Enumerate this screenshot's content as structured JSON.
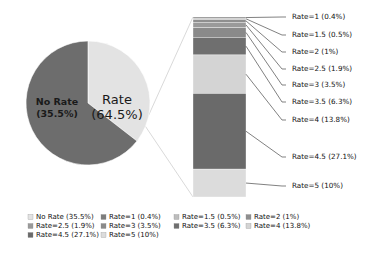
{
  "chart_data": {
    "type": "pie",
    "title": "",
    "subtitle": "",
    "xlabel": "",
    "ylabel": "",
    "legend_position": "bottom",
    "grid": false,
    "pie": {
      "categories": [
        "No Rate",
        "Rate"
      ],
      "values": [
        35.5,
        64.5
      ],
      "labels": [
        "No Rate\n(35.5%)",
        "Rate\n(64.5%)"
      ],
      "colors": [
        "#e3e3e3",
        "#6d6d6d"
      ],
      "start_angle_deg": 90,
      "direction": "clockwise"
    },
    "exploded_from": "Rate",
    "bar": {
      "orientation": "vertical-stacked",
      "total_percent": 64.5,
      "categories": [
        "Rate=1",
        "Rate=1.5",
        "Rate=2",
        "Rate=2.5",
        "Rate=3",
        "Rate=3.5",
        "Rate=4",
        "Rate=4.5",
        "Rate=5"
      ],
      "values": [
        0.4,
        0.5,
        1,
        1.9,
        3.5,
        6.3,
        13.8,
        27.1,
        10
      ],
      "colors": [
        "#7d7d7d",
        "#bdbdbd",
        "#8f8f8f",
        "#9a9a9a",
        "#8a8a8a",
        "#6f6f6f",
        "#d4d4d4",
        "#6a6a6a",
        "#dcdcdc"
      ]
    },
    "callouts": [
      {
        "label": "Rate=1 (0.4%)"
      },
      {
        "label": "Rate=1.5 (0.5%)"
      },
      {
        "label": "Rate=2 (1%)"
      },
      {
        "label": "Rate=2.5 (1.9%)"
      },
      {
        "label": "Rate=3 (3.5%)"
      },
      {
        "label": "Rate=3.5 (6.3%)"
      },
      {
        "label": "Rate=4 (13.8%)"
      },
      {
        "label": "Rate=4.5 (27.1%)"
      },
      {
        "label": "Rate=5 (10%)"
      }
    ],
    "legend": [
      {
        "label": "No Rate (35.5%)",
        "color": "#e3e3e3"
      },
      {
        "label": "Rate=1 (0.4%)",
        "color": "#7d7d7d"
      },
      {
        "label": "Rate=1.5 (0.5%)",
        "color": "#bdbdbd"
      },
      {
        "label": "Rate=2 (1%)",
        "color": "#8f8f8f"
      },
      {
        "label": "Rate=2.5 (1.9%)",
        "color": "#9a9a9a"
      },
      {
        "label": "Rate=3 (3.5%)",
        "color": "#8a8a8a"
      },
      {
        "label": "Rate=3.5 (6.3%)",
        "color": "#6f6f6f"
      },
      {
        "label": "Rate=4 (13.8%)",
        "color": "#d4d4d4"
      },
      {
        "label": "Rate=4.5 (27.1%)",
        "color": "#6a6a6a"
      },
      {
        "label": "Rate=5 (10%)",
        "color": "#dcdcdc"
      }
    ]
  },
  "pie_labels": {
    "no_rate_name": "No Rate",
    "no_rate_pct": "(35.5%)",
    "rate_name": "Rate",
    "rate_pct": "(64.5%)"
  }
}
